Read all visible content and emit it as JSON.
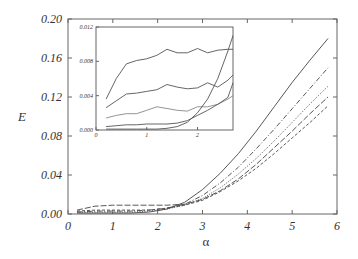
{
  "chart_data": [
    {
      "type": "line",
      "title": "",
      "xlabel": "α",
      "ylabel": "E",
      "xlim": [
        0,
        6
      ],
      "ylim": [
        0,
        0.2
      ],
      "xticks": [
        "0",
        "1",
        "2",
        "3",
        "4",
        "5",
        "6"
      ],
      "yticks": [
        "0.00",
        "0.04",
        "0.08",
        "0.12",
        "0.16",
        "0.20"
      ],
      "grid": false,
      "legend": null,
      "x": [
        0.2,
        0.6,
        1.0,
        1.4,
        1.8,
        2.2,
        2.6,
        3.0,
        3.4,
        3.8,
        4.2,
        4.6,
        5.0,
        5.4,
        5.8
      ],
      "series": [
        {
          "name": "solid",
          "style": "solid",
          "values": [
            0.001,
            0.001,
            0.001,
            0.001,
            0.002,
            0.005,
            0.012,
            0.025,
            0.042,
            0.062,
            0.085,
            0.11,
            0.135,
            0.158,
            0.18
          ]
        },
        {
          "name": "dash-dot",
          "style": "dashdot",
          "values": [
            0.002,
            0.003,
            0.003,
            0.003,
            0.004,
            0.006,
            0.01,
            0.019,
            0.032,
            0.048,
            0.067,
            0.087,
            0.108,
            0.129,
            0.15
          ]
        },
        {
          "name": "dotted",
          "style": "dotted",
          "values": [
            0.002,
            0.002,
            0.002,
            0.002,
            0.003,
            0.005,
            0.009,
            0.016,
            0.027,
            0.041,
            0.057,
            0.075,
            0.094,
            0.113,
            0.131
          ]
        },
        {
          "name": "long-dash",
          "style": "longdash",
          "values": [
            0.004,
            0.008,
            0.009,
            0.009,
            0.009,
            0.009,
            0.01,
            0.015,
            0.024,
            0.036,
            0.051,
            0.068,
            0.085,
            0.103,
            0.12
          ]
        },
        {
          "name": "dashed",
          "style": "dashed",
          "values": [
            0.003,
            0.004,
            0.004,
            0.004,
            0.004,
            0.006,
            0.009,
            0.014,
            0.023,
            0.034,
            0.047,
            0.062,
            0.078,
            0.094,
            0.111
          ]
        }
      ]
    },
    {
      "type": "line",
      "title": "inset",
      "xlim": [
        0,
        2.7
      ],
      "ylim": [
        0,
        0.012
      ],
      "xticks": [
        "0",
        "1",
        "2"
      ],
      "yticks": [
        "0.000",
        "0.004",
        "0.008",
        "0.012"
      ],
      "x": [
        0.2,
        0.4,
        0.6,
        0.8,
        1.0,
        1.2,
        1.4,
        1.6,
        1.8,
        2.0,
        2.2,
        2.4,
        2.6,
        2.7
      ],
      "series": [
        {
          "name": "top",
          "values": [
            0.0036,
            0.006,
            0.0077,
            0.0081,
            0.0083,
            0.0087,
            0.0094,
            0.009,
            0.009,
            0.0095,
            0.009,
            0.0093,
            0.0094,
            0.0094
          ]
        },
        {
          "name": "second",
          "values": [
            0.0026,
            0.0034,
            0.0042,
            0.0043,
            0.0045,
            0.0047,
            0.0053,
            0.005,
            0.0048,
            0.0049,
            0.0055,
            0.005,
            0.0058,
            0.0064
          ]
        },
        {
          "name": "third",
          "values": [
            0.0014,
            0.0017,
            0.0019,
            0.0019,
            0.0023,
            0.0027,
            0.0025,
            0.0023,
            0.0022,
            0.0027,
            0.0027,
            0.003,
            0.0036,
            0.004
          ]
        },
        {
          "name": "fourth",
          "values": [
            0.0004,
            0.0005,
            0.0006,
            0.0006,
            0.0007,
            0.0007,
            0.0007,
            0.0008,
            0.0011,
            0.0017,
            0.0023,
            0.003,
            0.0038,
            0.0055
          ]
        },
        {
          "name": "fifth",
          "values": [
            0.0001,
            0.0001,
            0.0001,
            0.0001,
            0.0001,
            0.0001,
            0.0002,
            0.0004,
            0.0009,
            0.002,
            0.0036,
            0.006,
            0.0092,
            0.011
          ]
        }
      ]
    }
  ],
  "labels": {
    "xlabel": "α",
    "ylabel": "E"
  },
  "colors": {
    "line": "#444444",
    "axis": "#666666",
    "inset_line": "#555555",
    "inset_light": "#888888"
  }
}
